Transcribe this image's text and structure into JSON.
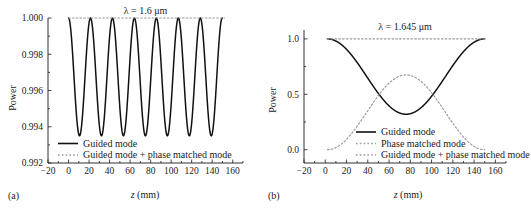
{
  "figure": {
    "panel_a_label": "(a)",
    "panel_b_label": "(b)"
  },
  "chart_data": [
    {
      "id": "panel_a",
      "type": "line",
      "title": "λ = 1.6 μm",
      "xlabel": "z (mm)",
      "ylabel": "Power",
      "xlim": [
        -20,
        170
      ],
      "ylim": [
        0.992,
        1.0
      ],
      "xticks": [
        -20,
        0,
        20,
        40,
        60,
        80,
        100,
        120,
        140,
        160
      ],
      "xticklabels": [
        "−20",
        "0",
        "20",
        "40",
        "60",
        "80",
        "100",
        "120",
        "140",
        "160"
      ],
      "yticks": [
        0.992,
        0.994,
        0.996,
        0.998,
        1.0
      ],
      "yticklabels": [
        "0.992",
        "0.994",
        "0.996",
        "0.998",
        "1.000"
      ],
      "minor_xtick_step": 10,
      "minor_ytick_count": 1,
      "grid": false,
      "legend_position": "lower-left",
      "series": [
        {
          "name": "Guided mode",
          "style": "solid",
          "color": "#111111",
          "waveform": "cosine",
          "x_start": 0,
          "x_end": 150,
          "ymax": 1.0,
          "ymin": 0.9935,
          "period": 21.4,
          "phase_deg": 0
        },
        {
          "name": "Guided mode + phase matched mode",
          "style": "dotted",
          "color": "#9a9a9a",
          "waveform": "constant",
          "x_start": 0,
          "x_end": 152,
          "value": 1.0
        }
      ]
    },
    {
      "id": "panel_b",
      "type": "line",
      "title": "λ = 1.645 μm",
      "xlabel": "z (mm)",
      "ylabel": "Power",
      "xlim": [
        -20,
        170
      ],
      "ylim": [
        -0.12,
        1.08
      ],
      "xticks": [
        -20,
        0,
        20,
        40,
        60,
        80,
        100,
        120,
        140,
        160
      ],
      "xticklabels": [
        "−20",
        "0",
        "20",
        "40",
        "60",
        "80",
        "100",
        "120",
        "140",
        "160"
      ],
      "yticks": [
        0.0,
        0.5,
        1.0
      ],
      "yticklabels": [
        "0.0",
        "0.5",
        "1.0"
      ],
      "minor_xtick_step": 10,
      "minor_ytick_count": 1,
      "grid": false,
      "legend_position": "lower-center",
      "series": [
        {
          "name": "Guided mode",
          "style": "solid",
          "color": "#111111",
          "waveform": "cosine",
          "x_start": 2,
          "x_end": 150,
          "ymax": 1.0,
          "ymin": 0.32,
          "period": 148,
          "phase_deg": 0
        },
        {
          "name": "Phase matched mode",
          "style": "dotted",
          "color": "#9a9a9a",
          "waveform": "inverted-cosine",
          "x_start": 2,
          "x_end": 150,
          "ymax": 0.675,
          "ymin": 0.0,
          "period": 148,
          "phase_deg": 0
        },
        {
          "name": "Guided mode + phase matched mode",
          "style": "dotted",
          "color": "#9a9a9a",
          "waveform": "constant",
          "x_start": 2,
          "x_end": 152,
          "value": 1.0
        }
      ]
    }
  ]
}
